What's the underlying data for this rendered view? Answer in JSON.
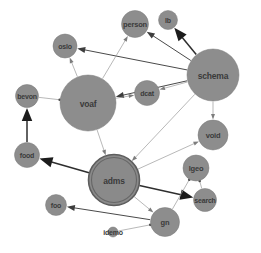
{
  "graph": {
    "type": "force-directed-node-link",
    "background_color": "#ffffff",
    "node_fill_color": "#8d8d8d",
    "node_label_color": "#3a3a3a",
    "edge_color": "#9a9a9a",
    "selected_node": "adms",
    "nodes": [
      {
        "id": "person",
        "label": "person",
        "x": 135,
        "y": 24,
        "r": 13.5,
        "selected": false
      },
      {
        "id": "lb",
        "label": "lb",
        "x": 168,
        "y": 20,
        "r": 9.5,
        "selected": false
      },
      {
        "id": "oslo",
        "label": "oslo",
        "x": 65,
        "y": 46,
        "r": 12.0,
        "selected": false
      },
      {
        "id": "schema",
        "label": "schema",
        "x": 213,
        "y": 75,
        "r": 26.0,
        "selected": false
      },
      {
        "id": "bevon",
        "label": "bevon",
        "x": 27,
        "y": 96,
        "r": 11.5,
        "selected": false
      },
      {
        "id": "voaf",
        "label": "voaf",
        "x": 88,
        "y": 103,
        "r": 28.0,
        "selected": false
      },
      {
        "id": "dcat",
        "label": "dcat",
        "x": 147,
        "y": 93,
        "r": 12.5,
        "selected": false
      },
      {
        "id": "void",
        "label": "void",
        "x": 213,
        "y": 135,
        "r": 15.0,
        "selected": false
      },
      {
        "id": "food",
        "label": "food",
        "x": 27,
        "y": 155,
        "r": 12.5,
        "selected": false
      },
      {
        "id": "adms",
        "label": "adms",
        "x": 114,
        "y": 180,
        "r": 25.5,
        "selected": true
      },
      {
        "id": "lgeo",
        "label": "lgeo",
        "x": 196,
        "y": 168,
        "r": 13.0,
        "selected": false
      },
      {
        "id": "search",
        "label": "search",
        "x": 205,
        "y": 200,
        "r": 11.5,
        "selected": false
      },
      {
        "id": "foo",
        "label": "foo",
        "x": 56,
        "y": 205,
        "r": 10.5,
        "selected": false
      },
      {
        "id": "gn",
        "label": "gn",
        "x": 165,
        "y": 222,
        "r": 14.5,
        "selected": false
      },
      {
        "id": "idemo",
        "label": "idemo",
        "x": 113,
        "y": 232,
        "r": 5.0,
        "selected": false
      }
    ],
    "edges": [
      {
        "source": "schema",
        "target": "oslo",
        "weight": "medium",
        "arrow": true
      },
      {
        "source": "schema",
        "target": "person",
        "weight": "medium",
        "arrow": true
      },
      {
        "source": "schema",
        "target": "lb",
        "weight": "thick",
        "arrow": true
      },
      {
        "source": "schema",
        "target": "dcat",
        "weight": "light",
        "arrow": true
      },
      {
        "source": "schema",
        "target": "void",
        "weight": "light",
        "arrow": true
      },
      {
        "source": "schema",
        "target": "voaf",
        "weight": "medium",
        "arrow": true
      },
      {
        "source": "schema",
        "target": "adms",
        "weight": "light",
        "arrow": true
      },
      {
        "source": "voaf",
        "target": "oslo",
        "weight": "light",
        "arrow": true
      },
      {
        "source": "voaf",
        "target": "person",
        "weight": "light",
        "arrow": true
      },
      {
        "source": "voaf",
        "target": "dcat",
        "weight": "light",
        "arrow": true
      },
      {
        "source": "voaf",
        "target": "bevon",
        "weight": "light",
        "arrow": false
      },
      {
        "source": "voaf",
        "target": "adms",
        "weight": "light",
        "arrow": true
      },
      {
        "source": "food",
        "target": "bevon",
        "weight": "thick",
        "arrow": true
      },
      {
        "source": "adms",
        "target": "food",
        "weight": "thick",
        "arrow": true
      },
      {
        "source": "adms",
        "target": "void",
        "weight": "light",
        "arrow": true
      },
      {
        "source": "adms",
        "target": "search",
        "weight": "thick",
        "arrow": true
      },
      {
        "source": "adms",
        "target": "gn",
        "weight": "light",
        "arrow": true
      },
      {
        "source": "gn",
        "target": "foo",
        "weight": "medium",
        "arrow": true
      },
      {
        "source": "gn",
        "target": "idemo",
        "weight": "light",
        "arrow": false
      },
      {
        "source": "lgeo",
        "target": "search",
        "weight": "light",
        "arrow": false
      },
      {
        "source": "lgeo",
        "target": "gn",
        "weight": "light",
        "arrow": false
      }
    ]
  }
}
